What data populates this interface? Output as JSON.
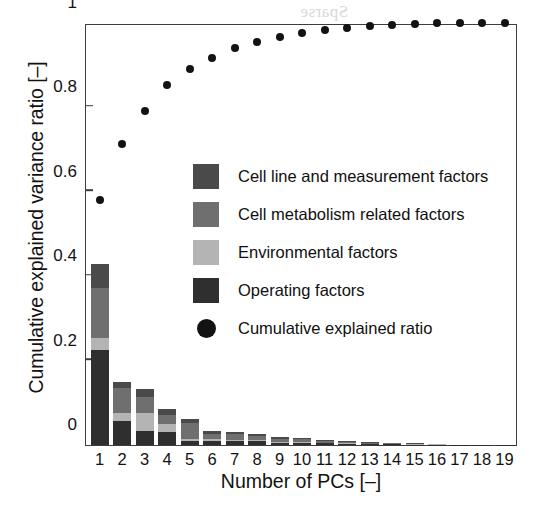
{
  "chart_data": {
    "type": "bar",
    "title": "",
    "subtitle": "",
    "xlabel": "Number of PCs [–]",
    "ylabel": "Cumulative explained variance ratio [–]",
    "xlim": [
      0.4,
      19.6
    ],
    "ylim": [
      0,
      1
    ],
    "grid": false,
    "legend_position": "center",
    "stacked": true,
    "categories": [
      "1",
      "2",
      "3",
      "4",
      "5",
      "6",
      "7",
      "8",
      "9",
      "10",
      "11",
      "12",
      "13",
      "14",
      "15",
      "16",
      "17",
      "18",
      "19"
    ],
    "xticklabels": [
      "1",
      "2",
      "3",
      "4",
      "5",
      "6",
      "7",
      "8",
      "9",
      "10",
      "11",
      "12",
      "13",
      "14",
      "15",
      "16",
      "17",
      "18",
      "19"
    ],
    "yticklabels": [
      "0",
      "0.2",
      "0.4",
      "0.6",
      "0.8",
      "1"
    ],
    "yticks": [
      0,
      0.2,
      0.4,
      0.6,
      0.8,
      1
    ],
    "series": [
      {
        "name": "Operating factors",
        "color": "#2f2f2f",
        "values": [
          0.225,
          0.058,
          0.033,
          0.031,
          0.01,
          0.01,
          0.01,
          0.009,
          0.005,
          0.005,
          0.004,
          0.003,
          0.002,
          0.002,
          0.001,
          0.001,
          0.001,
          0.001,
          0.001
        ]
      },
      {
        "name": "Environmental factors",
        "color": "#b4b4b4",
        "values": [
          0.028,
          0.018,
          0.043,
          0.018,
          0.005,
          0.004,
          0.003,
          0.003,
          0.002,
          0.002,
          0.001,
          0.001,
          0.001,
          0.001,
          0.001,
          0.001,
          0.0,
          0.0,
          0.0
        ]
      },
      {
        "name": "Cell metabolism related factors",
        "color": "#6f6f6f",
        "values": [
          0.118,
          0.058,
          0.037,
          0.022,
          0.036,
          0.012,
          0.012,
          0.01,
          0.008,
          0.007,
          0.004,
          0.003,
          0.002,
          0.001,
          0.001,
          0.001,
          0.0,
          0.0,
          0.0
        ]
      },
      {
        "name": "Cell line and measurement factors",
        "color": "#4a4a4a",
        "values": [
          0.059,
          0.016,
          0.019,
          0.014,
          0.011,
          0.007,
          0.006,
          0.005,
          0.004,
          0.003,
          0.002,
          0.002,
          0.001,
          0.001,
          0.001,
          0.0,
          0.0,
          0.0,
          0.0
        ]
      }
    ],
    "overlay": {
      "name": "Cumulative explained ratio",
      "type": "scatter",
      "marker": "circle",
      "color": "#131313",
      "x": [
        1,
        2,
        3,
        4,
        5,
        6,
        7,
        8,
        9,
        10,
        11,
        12,
        13,
        14,
        15,
        16,
        17,
        18,
        19
      ],
      "values": [
        0.58,
        0.713,
        0.791,
        0.853,
        0.89,
        0.918,
        0.94,
        0.955,
        0.968,
        0.977,
        0.984,
        0.989,
        0.993,
        0.996,
        0.998,
        0.999,
        0.999,
        1.0,
        1.0
      ]
    },
    "legend": [
      {
        "label": "Cell line and measurement factors",
        "color": "#4a4a4a",
        "marker": "square"
      },
      {
        "label": "Cell metabolism related factors",
        "color": "#6f6f6f",
        "marker": "square"
      },
      {
        "label": "Environmental factors",
        "color": "#b4b4b4",
        "marker": "square"
      },
      {
        "label": "Operating factors",
        "color": "#2f2f2f",
        "marker": "square"
      },
      {
        "label": "Cumulative explained ratio",
        "color": "#131313",
        "marker": "circle"
      }
    ]
  },
  "ghost_text": [
    {
      "text": "Sparse",
      "x": 300,
      "y": 2,
      "size": 17
    },
    {
      "text": "Sherlock, A. A.",
      "x": 250,
      "y": 94,
      "size": 19
    },
    {
      "text": "opment of Hybrid mod",
      "x": 230,
      "y": 124,
      "size": 19
    },
    {
      "text": "Multiparametric Design",
      "x": 230,
      "y": 212,
      "size": 19
    },
    {
      "text": "Processing of Biopharma",
      "x": 215,
      "y": 268,
      "size": 19
    },
    {
      "text": "ty Production and Process Analy",
      "x": 200,
      "y": 292,
      "size": 19
    },
    {
      "text": "vist, J. A., Vanhove, R. Langer, E.",
      "x": 210,
      "y": 358,
      "size": 19
    },
    {
      "text": "cess biology, process and cellular",
      "x": 205,
      "y": 386,
      "size": 19
    }
  ]
}
